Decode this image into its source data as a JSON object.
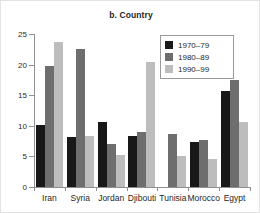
{
  "chart_data": {
    "type": "bar",
    "title": "b. Country",
    "xlabel": "",
    "ylabel": "",
    "ylim": [
      0,
      25
    ],
    "yticks": [
      0,
      5,
      10,
      15,
      20,
      25
    ],
    "ytick_labels": [
      "0",
      "5",
      "10",
      "15",
      "20",
      "25"
    ],
    "grid": false,
    "legend_position": "top-right",
    "categories": [
      "Iran",
      "Syria",
      "Jordan",
      "Djibouti",
      "Tunisia",
      "Morocco",
      "Egypt"
    ],
    "series": [
      {
        "name": "1970–79",
        "color": "#181818",
        "values": [
          10.2,
          8.2,
          10.7,
          8.3,
          0,
          7.4,
          15.7
        ]
      },
      {
        "name": "1980–89",
        "color": "#6e6e6e",
        "values": [
          19.8,
          22.5,
          7.0,
          9.0,
          8.7,
          7.7,
          17.5
        ]
      },
      {
        "name": "1990–99",
        "color": "#bdbdbd",
        "values": [
          23.7,
          8.3,
          5.2,
          20.4,
          5.0,
          4.6,
          10.6
        ]
      }
    ]
  },
  "legend": {
    "items": [
      {
        "label": "1970–79",
        "color": "#181818"
      },
      {
        "label": "1980–89",
        "color": "#6e6e6e"
      },
      {
        "label": "1990–99",
        "color": "#bdbdbd"
      }
    ]
  },
  "colors": {
    "series_1970_79": "#181818",
    "series_1980_89": "#6e6e6e",
    "series_1990_99": "#bdbdbd",
    "axis": "#8f8f8f",
    "text": "#1f1f1f",
    "background": "#ffffff"
  }
}
